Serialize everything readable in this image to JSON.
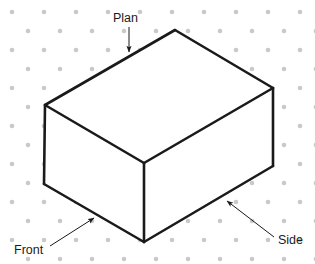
{
  "diagram": {
    "background_color": "#ffffff",
    "stroke_color": "#1a1a1a",
    "stroke_width": 2.6,
    "grid": {
      "type": "isometric-dot-grid",
      "dot_color": "#c9c9c9",
      "dot_radius": 2.3,
      "col_spacing": 32,
      "row_spacing": 38,
      "row_offset_x": 16,
      "row_offset_y": 19,
      "origin_x": 12,
      "origin_y": 12
    },
    "solid": {
      "shape": "cuboid",
      "projection": "isometric",
      "vertices": {
        "top_back": [
          175,
          30
        ],
        "top_left": [
          45,
          105
        ],
        "top_right": [
          273,
          88
        ],
        "top_front": [
          144,
          163
        ],
        "bottom_left": [
          44,
          184
        ],
        "bottom_front": [
          144,
          242
        ],
        "bottom_right": [
          273,
          166
        ]
      },
      "faces": [
        {
          "name": "plan-face",
          "points": "45,105 175,30 273,88 144,163"
        },
        {
          "name": "front-face",
          "points": "45,105 144,163 144,242 44,184"
        },
        {
          "name": "side-face",
          "points": "144,163 273,88 273,166 144,242"
        }
      ]
    },
    "labels": [
      {
        "id": "plan",
        "text": "Plan",
        "text_x": 113,
        "text_y": 22,
        "anchor": "start",
        "arrow": {
          "x1": 129,
          "y1": 27,
          "x2": 129,
          "y2": 52
        }
      },
      {
        "id": "front",
        "text": "Front",
        "text_x": 14,
        "text_y": 254,
        "anchor": "start",
        "arrow": {
          "x1": 50,
          "y1": 246,
          "x2": 94,
          "y2": 218
        }
      },
      {
        "id": "side",
        "text": "Side",
        "text_x": 278,
        "text_y": 244,
        "anchor": "start",
        "arrow": {
          "x1": 274,
          "y1": 237,
          "x2": 227,
          "y2": 201
        }
      }
    ],
    "arrow_style": {
      "color": "#1a1a1a",
      "line_width": 1,
      "head_length": 7,
      "head_width": 5
    }
  }
}
